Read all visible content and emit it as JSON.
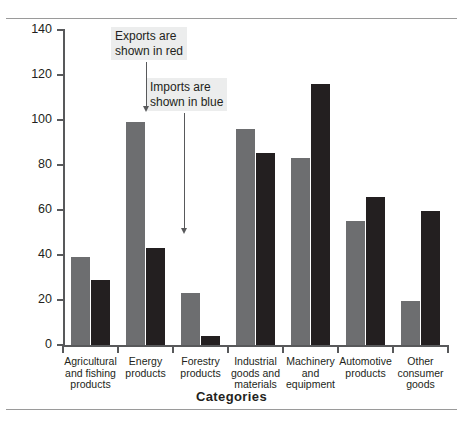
{
  "chart_data": {
    "type": "bar",
    "title": "",
    "subtitle": "",
    "xlabel": "Categories",
    "ylabel": "$ Billions",
    "ylim": [
      0,
      140
    ],
    "yticks": [
      0,
      20,
      40,
      60,
      80,
      100,
      120,
      140
    ],
    "grid": false,
    "legend_position": "annotation",
    "categories": [
      "Agricultural\nand fishing\nproducts",
      "Energy\nproducts",
      "Forestry\nproducts",
      "Industrial\ngoods and\nmaterials",
      "Machinery\nand\nequipment",
      "Automotive\nproducts",
      "Other\nconsumer\ngoods"
    ],
    "series": [
      {
        "name": "Exports",
        "color": "#6d6e70",
        "values": [
          39,
          99,
          23,
          96,
          83,
          55,
          19.5
        ]
      },
      {
        "name": "Imports",
        "color": "#231f20",
        "values": [
          29,
          43,
          4,
          85.5,
          116,
          66,
          59.5
        ]
      }
    ],
    "annotations": [
      {
        "id": "exports-note",
        "text": "Exports are\nshown in red"
      },
      {
        "id": "imports-note",
        "text": "Imports are\nshown in blue"
      }
    ]
  },
  "colors": {
    "exports_bar": "#6d6e70",
    "imports_bar": "#231f20",
    "axis": "#58595b",
    "annotation_background": "#eceded",
    "rule": "#9a9a9a",
    "page_background": "#ffffff"
  }
}
